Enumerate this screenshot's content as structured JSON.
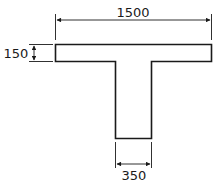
{
  "diagram": {
    "type": "T-section cross-section",
    "dimensions": {
      "flange_width": "1500",
      "flange_thickness": "150",
      "web_width": "350"
    },
    "colors": {
      "line": "#1a1a1a",
      "background": "#ffffff"
    }
  }
}
